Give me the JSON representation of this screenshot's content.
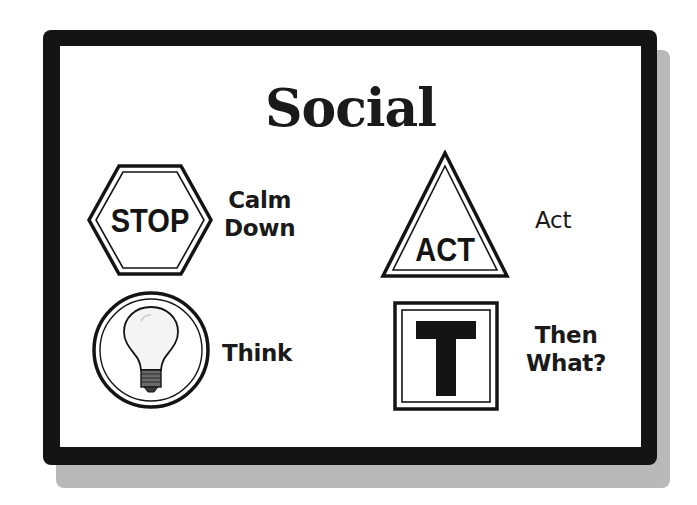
{
  "card": {
    "title": "Social",
    "colors": {
      "frame": "#141414",
      "panel": "#ffffff",
      "shadow": "#b9b9b9",
      "text": "#1a1a1a"
    },
    "steps": [
      {
        "sign_shape": "hexagon",
        "sign_text": "STOP",
        "icon": "stop-sign-icon",
        "label_lines": [
          "Calm",
          "Down"
        ]
      },
      {
        "sign_shape": "triangle",
        "sign_text": "ACT",
        "icon": "act-triangle-icon",
        "label_lines": [
          "Act"
        ]
      },
      {
        "sign_shape": "circle",
        "sign_text": "",
        "icon": "lightbulb-icon",
        "label_lines": [
          "Think"
        ]
      },
      {
        "sign_shape": "square",
        "sign_text": "T",
        "icon": "t-square-icon",
        "label_lines": [
          "Then",
          "What?"
        ]
      }
    ]
  }
}
